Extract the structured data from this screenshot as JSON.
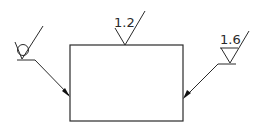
{
  "drawing": {
    "type": "surface-finish-annotation",
    "part": {
      "shape": "rectangle",
      "x": 70,
      "y": 45,
      "width": 113,
      "height": 76
    },
    "symbols": [
      {
        "id": "left",
        "kind": "machining-prohibited",
        "value": "",
        "modifier": "circle",
        "leader": "arrow-to-left-edge"
      },
      {
        "id": "top",
        "kind": "basic-surface-texture",
        "value": "1.2",
        "leader": "on-top-edge"
      },
      {
        "id": "right",
        "kind": "material-removal-required",
        "value": "1.6",
        "leader": "arrow-to-right-edge"
      }
    ],
    "colors": {
      "line": "#2a2a2a",
      "background": "#ffffff"
    }
  }
}
